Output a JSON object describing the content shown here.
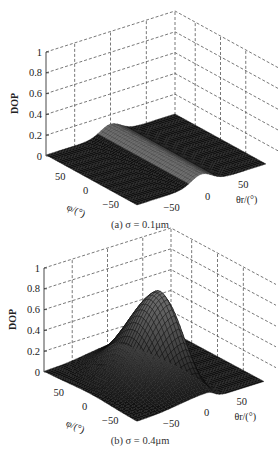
{
  "chart_data": [
    {
      "type": "surface3d",
      "panel": "a",
      "caption": "(a) σ = 0.1μm",
      "zlabel": "DOP",
      "xlabel": "θr/(°)",
      "ylabel": "φ/(°)",
      "zticks": [
        "0",
        "0.2",
        "0.4",
        "0.6",
        "0.8",
        "1"
      ],
      "xticks": [
        "-50",
        "0",
        "50"
      ],
      "yticks": [
        "50",
        "0",
        "-50"
      ],
      "zlim": [
        0,
        1
      ],
      "xlim": [
        -90,
        90
      ],
      "ylim": [
        -90,
        90
      ],
      "grid": true,
      "description": "Mostly near-zero DOP floor with a faint ridge (~0.1) along θr≈0 spanning all φ",
      "peak": {
        "theta_r": 0,
        "phi": 0,
        "dop": 0.1
      },
      "ridge": {
        "theta_r_center": 0,
        "theta_r_width": 20,
        "dop": 0.1
      }
    },
    {
      "type": "surface3d",
      "panel": "b",
      "caption": "(b) σ = 0.4μm",
      "zlabel": "DOP",
      "xlabel": "θr/(°)",
      "ylabel": "φ/(°)",
      "zticks": [
        "0",
        "0.2",
        "0.4",
        "0.6",
        "0.8",
        "1"
      ],
      "xticks": [
        "-50",
        "0",
        "50"
      ],
      "yticks": [
        "50",
        "0",
        "-50"
      ],
      "zlim": [
        0,
        1
      ],
      "xlim": [
        -90,
        90
      ],
      "ylim": [
        -90,
        90
      ],
      "grid": true,
      "description": "Sharp peak of DOP ≈0.8 near θr≈10°, φ≈0 rising from a near-zero floor",
      "peak": {
        "theta_r": 10,
        "phi": 0,
        "dop": 0.8
      }
    }
  ],
  "panels": {
    "a": {
      "caption": "(a) σ = 0.1μm",
      "zlabel": "DOP",
      "xlabel": "θr/(°)",
      "ylabel": "φ/(°)"
    },
    "b": {
      "caption": "(b) σ = 0.4μm",
      "zlabel": "DOP",
      "xlabel": "θr/(°)",
      "ylabel": "φ/(°)"
    }
  },
  "style": {
    "surface_color": "#111111",
    "mesh_highlight": "#9a9a9a",
    "grid_color": "#555555"
  }
}
